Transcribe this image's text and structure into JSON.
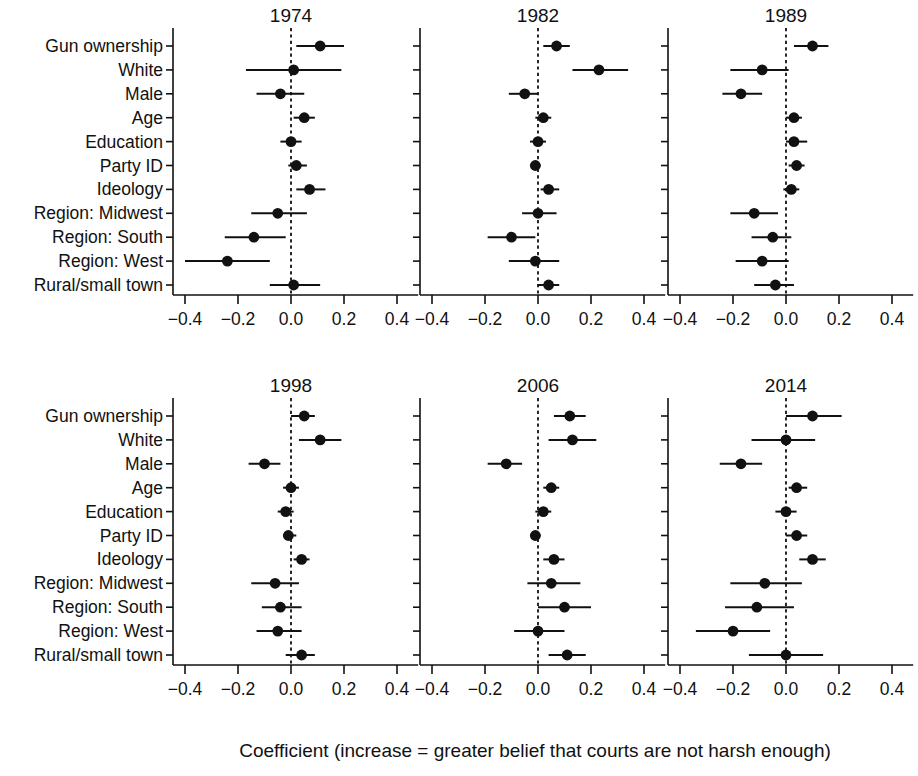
{
  "figure": {
    "x_axis_caption": "Coefficient (increase = greater belief that courts are not harsh enough)",
    "x_tick_labels": [
      "−0.4",
      "−0.2",
      "0.0",
      "0.2",
      "0.4"
    ],
    "row_labels": [
      "Gun ownership",
      "White",
      "Male",
      "Age",
      "Education",
      "Party ID",
      "Ideology",
      "Region: Midwest",
      "Region: South",
      "Region: West",
      "Rural/small town"
    ],
    "colors": {
      "ink": "#111111",
      "background": "#ffffff"
    }
  },
  "chart_data": {
    "type": "scatter",
    "title": "",
    "xlabel": "Coefficient (increase = greater belief that courts are not harsh enough)",
    "ylabel": "",
    "xlim": [
      -0.5,
      0.5
    ],
    "xticks": [
      -0.4,
      -0.2,
      0.0,
      0.2,
      0.4
    ],
    "xtick_labels": [
      "−0.4",
      "−0.2",
      "0.0",
      "0.2",
      "0.4"
    ],
    "grid": false,
    "legend": false,
    "reference_line": 0.0,
    "reference_line_style": "dotted",
    "categories": [
      "Gun ownership",
      "White",
      "Male",
      "Age",
      "Education",
      "Party ID",
      "Ideology",
      "Region: Midwest",
      "Region: South",
      "Region: West",
      "Rural/small town"
    ],
    "panel_layout": {
      "rows": 2,
      "cols": 3
    },
    "panels": [
      {
        "title": "1974",
        "estimates": [
          0.11,
          0.01,
          -0.04,
          0.05,
          0.0,
          0.02,
          0.07,
          -0.05,
          -0.14,
          -0.24,
          0.01
        ],
        "ci_low": [
          0.02,
          -0.17,
          -0.13,
          0.01,
          -0.04,
          -0.01,
          0.02,
          -0.15,
          -0.25,
          -0.4,
          -0.08
        ],
        "ci_high": [
          0.2,
          0.19,
          0.05,
          0.09,
          0.04,
          0.06,
          0.13,
          0.06,
          -0.02,
          -0.08,
          0.11
        ]
      },
      {
        "title": "1982",
        "estimates": [
          0.07,
          0.23,
          -0.05,
          0.02,
          0.0,
          -0.01,
          0.04,
          0.0,
          -0.1,
          -0.01,
          0.04
        ],
        "ci_low": [
          0.02,
          0.13,
          -0.11,
          -0.01,
          -0.03,
          -0.03,
          0.01,
          -0.06,
          -0.19,
          -0.11,
          0.0
        ],
        "ci_high": [
          0.12,
          0.34,
          0.0,
          0.05,
          0.03,
          0.01,
          0.08,
          0.07,
          -0.01,
          0.08,
          0.08
        ]
      },
      {
        "title": "1989",
        "estimates": [
          0.1,
          -0.09,
          -0.17,
          0.03,
          0.03,
          0.04,
          0.02,
          -0.12,
          -0.05,
          -0.09,
          -0.04
        ],
        "ci_low": [
          0.03,
          -0.21,
          -0.24,
          0.0,
          0.0,
          0.01,
          -0.01,
          -0.21,
          -0.13,
          -0.19,
          -0.12
        ],
        "ci_high": [
          0.16,
          0.01,
          -0.09,
          0.06,
          0.08,
          0.07,
          0.05,
          -0.03,
          0.02,
          0.01,
          0.03
        ]
      },
      {
        "title": "1998",
        "estimates": [
          0.05,
          0.11,
          -0.1,
          0.0,
          -0.02,
          -0.01,
          0.04,
          -0.06,
          -0.04,
          -0.05,
          0.04
        ],
        "ci_low": [
          0.0,
          0.03,
          -0.16,
          -0.03,
          -0.05,
          -0.03,
          0.01,
          -0.15,
          -0.11,
          -0.13,
          -0.02
        ],
        "ci_high": [
          0.09,
          0.19,
          -0.04,
          0.03,
          0.01,
          0.02,
          0.07,
          0.03,
          0.04,
          0.04,
          0.09
        ]
      },
      {
        "title": "2006",
        "estimates": [
          0.12,
          0.13,
          -0.12,
          0.05,
          0.02,
          -0.01,
          0.06,
          0.05,
          0.1,
          0.0,
          0.11
        ],
        "ci_low": [
          0.06,
          0.04,
          -0.19,
          0.02,
          -0.01,
          -0.03,
          0.02,
          -0.04,
          0.0,
          -0.09,
          0.04
        ],
        "ci_high": [
          0.18,
          0.22,
          -0.06,
          0.08,
          0.05,
          0.01,
          0.1,
          0.16,
          0.2,
          0.1,
          0.18
        ]
      },
      {
        "title": "2014",
        "estimates": [
          0.1,
          0.0,
          -0.17,
          0.04,
          0.0,
          0.04,
          0.1,
          -0.08,
          -0.11,
          -0.2,
          0.0
        ],
        "ci_low": [
          0.0,
          -0.13,
          -0.25,
          0.01,
          -0.04,
          0.0,
          0.05,
          -0.21,
          -0.23,
          -0.34,
          -0.14
        ],
        "ci_high": [
          0.21,
          0.11,
          -0.09,
          0.08,
          0.04,
          0.08,
          0.15,
          0.06,
          0.03,
          -0.06,
          0.14
        ]
      }
    ]
  }
}
